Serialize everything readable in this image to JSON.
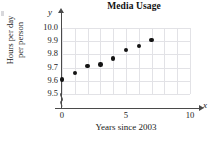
{
  "chart_data": {
    "type": "scatter",
    "title": "Media Usage",
    "xlabel": "Years since 2003",
    "ylabel_line1": "Hours per day",
    "ylabel_line2": "per person",
    "x_axis_symbol": "x",
    "y_axis_symbol": "y",
    "xlim": [
      0,
      10
    ],
    "ylim": [
      9.5,
      10.0
    ],
    "y_axis_break": true,
    "grid": true,
    "legend": null,
    "x_ticks": [
      {
        "value": 0,
        "label": "0"
      },
      {
        "value": 5,
        "label": "5"
      },
      {
        "value": 10,
        "label": "10"
      }
    ],
    "y_ticks": [
      {
        "value": 10.0,
        "label": "10.0"
      },
      {
        "value": 9.9,
        "label": "9.9"
      },
      {
        "value": 9.8,
        "label": "9.8"
      },
      {
        "value": 9.7,
        "label": "9.7"
      },
      {
        "value": 9.6,
        "label": "9.6"
      },
      {
        "value": 9.5,
        "label": "9.5"
      }
    ],
    "x": [
      0,
      1,
      2,
      3,
      4,
      5,
      6,
      7
    ],
    "values": [
      9.61,
      9.66,
      9.71,
      9.725,
      9.77,
      9.835,
      9.865,
      9.91
    ],
    "point_color": "#141414",
    "axis_color": "#4a4a4a",
    "grid_color": "#e2e2e6"
  }
}
